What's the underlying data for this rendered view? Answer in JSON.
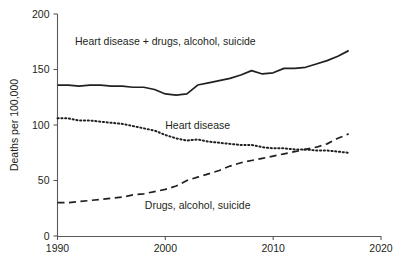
{
  "chart_data": {
    "type": "line",
    "title": "",
    "subtitle": "",
    "xlabel": "",
    "ylabel": "Deaths per 100,000",
    "xlim": [
      1990,
      2020
    ],
    "ylim": [
      0,
      200
    ],
    "xticks": [
      1990,
      2000,
      2010,
      2020
    ],
    "yticks": [
      0,
      50,
      100,
      150,
      200
    ],
    "xtick_labels": [
      "1990",
      "2000",
      "2010",
      "2020"
    ],
    "ytick_labels": [
      "0",
      "50",
      "100",
      "150",
      "200"
    ],
    "grid": false,
    "legend_position": "inline-annotations",
    "x": [
      1990,
      1991,
      1992,
      1993,
      1994,
      1995,
      1996,
      1997,
      1998,
      1999,
      2000,
      2001,
      2002,
      2003,
      2004,
      2005,
      2006,
      2007,
      2008,
      2009,
      2010,
      2011,
      2012,
      2013,
      2014,
      2015,
      2016,
      2017
    ],
    "series": [
      {
        "name": "Heart disease + drugs, alcohol, suicide",
        "style": "solid",
        "color": "#231f20",
        "label_text": "Heart disease + drugs, alcohol, suicide",
        "values": [
          136,
          136,
          135,
          136,
          136,
          135,
          135,
          134,
          134,
          132,
          128,
          127,
          128,
          136,
          138,
          140,
          142,
          145,
          149,
          146,
          147,
          151,
          151,
          152,
          155,
          158,
          162,
          167
        ]
      },
      {
        "name": "Heart disease",
        "style": "dotted",
        "color": "#231f20",
        "label_text": "Heart disease",
        "values": [
          106,
          106,
          104,
          104,
          103,
          102,
          101,
          99,
          97,
          95,
          91,
          88,
          86,
          87,
          85,
          84,
          83,
          82,
          82,
          80,
          79,
          79,
          78,
          78,
          77,
          77,
          76,
          75
        ]
      },
      {
        "name": "Drugs, alcohol, suicide",
        "style": "dashed",
        "color": "#231f20",
        "label_text": "Drugs, alcohol, suicide",
        "values": [
          30,
          30,
          31,
          32,
          33,
          34,
          35,
          37,
          38,
          40,
          42,
          45,
          50,
          53,
          56,
          59,
          63,
          66,
          68,
          70,
          72,
          74,
          76,
          78,
          80,
          83,
          88,
          92
        ]
      }
    ],
    "annotations": [
      {
        "id": "combined",
        "text": "Heart disease + drugs, alcohol, suicide",
        "x": 2000,
        "y": 172
      },
      {
        "id": "heart",
        "text": "Heart disease",
        "x": 2003,
        "y": 96
      },
      {
        "id": "drugs",
        "text": "Drugs, alcohol, suicide",
        "x": 2003,
        "y": 24
      }
    ]
  },
  "axes": {
    "y_title": "Deaths per 100,000"
  }
}
